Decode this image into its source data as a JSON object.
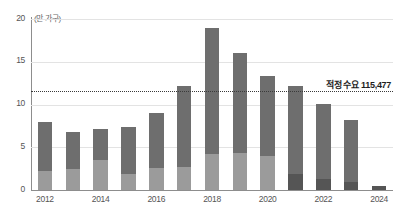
{
  "chart_data": {
    "type": "bar",
    "title": "",
    "subtitle": "",
    "xlabel": "",
    "ylabel": "",
    "unit_label": "(만 가구)",
    "ylim": [
      0,
      20
    ],
    "yticks": [
      0,
      5,
      10,
      15,
      20
    ],
    "ytick_labels": [
      "0",
      "5",
      "10",
      "15",
      "20"
    ],
    "grid": true,
    "legend": "none",
    "stacked": true,
    "categories": [
      "2012",
      "2013",
      "2014",
      "2015",
      "2016",
      "2017",
      "2018",
      "2019",
      "2020",
      "2021",
      "2022",
      "2023",
      "2024"
    ],
    "xtick_labels_visible": [
      "2012",
      "2014",
      "2016",
      "2018",
      "2020",
      "2022",
      "2024"
    ],
    "series": [
      {
        "name": "하위 구간",
        "color": "#9b9b9b",
        "values": [
          2.2,
          2.5,
          3.5,
          1.9,
          2.6,
          2.7,
          4.2,
          4.3,
          4.0,
          1.9,
          1.3,
          0.9,
          0.5
        ]
      },
      {
        "name": "상위 구간",
        "color": "#6e6e6e",
        "values": [
          5.8,
          4.3,
          3.6,
          5.5,
          6.4,
          9.5,
          14.8,
          11.7,
          9.3,
          10.3,
          8.8,
          7.3,
          0.0
        ]
      }
    ],
    "totals": [
      8.0,
      6.8,
      7.1,
      7.4,
      9.0,
      12.2,
      19.0,
      16.0,
      13.3,
      12.2,
      10.1,
      8.2,
      0.5
    ],
    "recent_years_highlight": {
      "from_category": "2021",
      "lower_color": "#555555"
    },
    "annotations": [
      {
        "name": "threshold-line",
        "type": "hline",
        "value": 11.5477,
        "label": "적정 수요 115,477",
        "style": "dotted",
        "color": "#3a3a3a"
      }
    ],
    "caption": ""
  },
  "colors": {
    "bar_lower": "#9b9b9b",
    "bar_upper": "#6e6e6e",
    "bar_lower_recent": "#555555",
    "axis": "#8d8d8d",
    "grid": "#e3e3e3",
    "text": "#555555",
    "annotation_text": "#1e1e1e",
    "background": "#ffffff"
  }
}
